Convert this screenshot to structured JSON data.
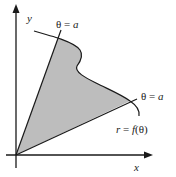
{
  "diagram": {
    "type": "polar-region",
    "axes": {
      "x_label": "x",
      "y_label": "y"
    },
    "rays": [
      {
        "label_theta": "θ",
        "label_eq": " = ",
        "label_val": "a",
        "position": "upper"
      },
      {
        "label_theta": "θ",
        "label_eq": " = ",
        "label_val": "a",
        "position": "lower"
      }
    ],
    "curve": {
      "label_r": "r",
      "label_eq": " = ",
      "label_f": "f",
      "label_arg": "(θ)"
    },
    "colors": {
      "region_fill": "#bdbdbd",
      "stroke": "#1a1a1a",
      "background": "#ffffff"
    }
  }
}
